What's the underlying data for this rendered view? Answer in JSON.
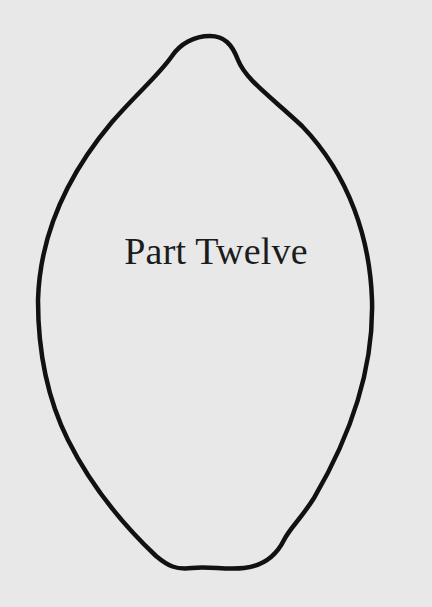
{
  "page": {
    "heading": "Part Twelve",
    "outline_shape": "lemon-outline",
    "colors": {
      "background": "#e8e8e8",
      "outline": "#111111",
      "text": "#1c1c1c"
    }
  }
}
